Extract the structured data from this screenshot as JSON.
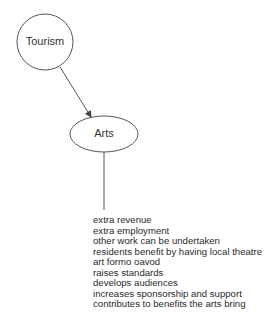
{
  "diagram": {
    "nodes": [
      {
        "id": "tourism",
        "label": "Tourism",
        "shape": "circle"
      },
      {
        "id": "arts",
        "label": "Arts",
        "shape": "ellipse"
      }
    ],
    "edges": [
      {
        "from": "tourism",
        "to": "arts",
        "type": "arrow"
      },
      {
        "from": "arts",
        "to": "benefits",
        "type": "line"
      }
    ],
    "benefits": [
      "extra revenue",
      "extra employment",
      "other work can be undertaken",
      "residents benefit by having local theatre",
      "art formo oavod",
      "raises standards",
      "develops audiences",
      "increases sponsorship and support",
      "contributes to benefits the arts bring"
    ],
    "colors": {
      "stroke": "#555555",
      "text": "#2a2a2a",
      "background": "#ffffff"
    }
  }
}
